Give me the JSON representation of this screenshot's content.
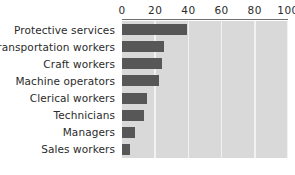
{
  "chart_data": {
    "type": "bar",
    "orientation": "horizontal",
    "title": "",
    "subtitle": "",
    "xlabel": "",
    "ylabel": "",
    "xlim": [
      0,
      100
    ],
    "ylim": null,
    "grid": true,
    "legend": null,
    "legend_position": "none",
    "categories": [
      "Protective services",
      "Transportation workers",
      "Craft workers",
      "Machine operators",
      "Clerical workers",
      "Technicians",
      "Managers",
      "Sales workers"
    ],
    "values": [
      39,
      25,
      24,
      22,
      15,
      13,
      8,
      5
    ],
    "xticks": [
      0,
      20,
      40,
      60,
      80,
      100
    ],
    "xtick_labels": [
      "0",
      "20",
      "40",
      "60",
      "80",
      "100"
    ],
    "annotations": []
  },
  "style": {
    "bar_color": "#575757",
    "plot_background": "#d9d9d9",
    "gridline_color": "#f2f2f2",
    "page_background": "#ffffff",
    "text_color": "#2b2b2b",
    "axis_line_color": "#6f6f6f"
  }
}
